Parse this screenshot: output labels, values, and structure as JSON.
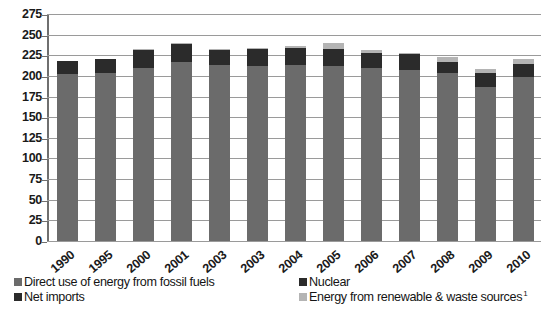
{
  "chart_data": {
    "type": "bar",
    "stacked": true,
    "title": "",
    "xlabel": "",
    "ylabel": "",
    "ylim": [
      0,
      275
    ],
    "ytick_step": 25,
    "yticks": [
      0,
      25,
      50,
      75,
      100,
      125,
      150,
      175,
      200,
      225,
      250,
      275
    ],
    "grid": true,
    "legend_position": "bottom",
    "categories": [
      "1990",
      "1995",
      "2000",
      "2001",
      "2003",
      "2003",
      "2004",
      "2005",
      "2006",
      "2007",
      "2008",
      "2009",
      "2010"
    ],
    "series": [
      {
        "name": "Direct use of energy from fossil fuels",
        "color": "#6b6b6b",
        "values": [
          202,
          203,
          209,
          217,
          213,
          212,
          213,
          212,
          209,
          207,
          203,
          186,
          199
        ]
      },
      {
        "name": "Nuclear",
        "color": "#2b2b2b",
        "values": [
          16,
          18,
          23,
          22,
          19,
          21,
          21,
          21,
          19,
          19,
          14,
          17,
          15
        ]
      },
      {
        "name": "Net imports",
        "color": "#2b2b2b",
        "values": [
          0,
          0,
          0,
          0,
          0,
          0,
          0,
          0,
          0,
          0,
          0,
          0,
          0
        ]
      },
      {
        "name": "Energy from renewable & waste sources",
        "color": "#b4b4b4",
        "values": [
          0,
          0,
          1,
          1,
          1,
          1,
          2,
          7,
          3,
          2,
          6,
          5,
          6
        ]
      }
    ],
    "totals": [
      218,
      221,
      233,
      240,
      233,
      234,
      236,
      240,
      231,
      228,
      223,
      208,
      220
    ]
  },
  "axis": {
    "y_tick_labels": [
      "275",
      "250",
      "225",
      "200",
      "175",
      "150",
      "125",
      "100",
      "75",
      "50",
      "25",
      "0"
    ],
    "x_tick_labels": [
      "1990",
      "1995",
      "2000",
      "2001",
      "2003",
      "2003",
      "2004",
      "2005",
      "2006",
      "2007",
      "2008",
      "2009",
      "2010"
    ]
  },
  "legend": {
    "items": [
      {
        "label": "Direct use of energy from fossil fuels",
        "swatch": "fossil-swatch",
        "footnote": ""
      },
      {
        "label": "Nuclear",
        "swatch": "nuclear-swatch",
        "footnote": ""
      },
      {
        "label": "Net imports",
        "swatch": "net-imports-swatch",
        "footnote": ""
      },
      {
        "label": "Energy from renewable & waste sources",
        "swatch": "renewable-swatch",
        "footnote": "1"
      }
    ]
  },
  "colors": {
    "fossil": "#6b6b6b",
    "nuclear": "#2b2b2b",
    "net_imports": "#2b2b2b",
    "renewable": "#b4b4b4",
    "gridline": "#9a9a9a",
    "axis": "#6f6f6f",
    "background": "#ffffff"
  }
}
